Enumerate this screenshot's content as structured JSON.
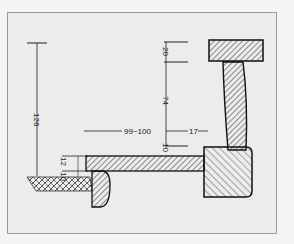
{
  "diagram": {
    "type": "cross-section",
    "colors": {
      "background": "#ececea",
      "ink": "#222222",
      "hatch": "#555555",
      "border": "#9a9a98"
    },
    "dimensions": {
      "total_height": "126",
      "cap_height": "20",
      "post_height": "74",
      "horizontal_span": "99~100",
      "offset": "17",
      "gap_a": "10",
      "slab_thickness": "12",
      "gap_b": "10"
    }
  }
}
